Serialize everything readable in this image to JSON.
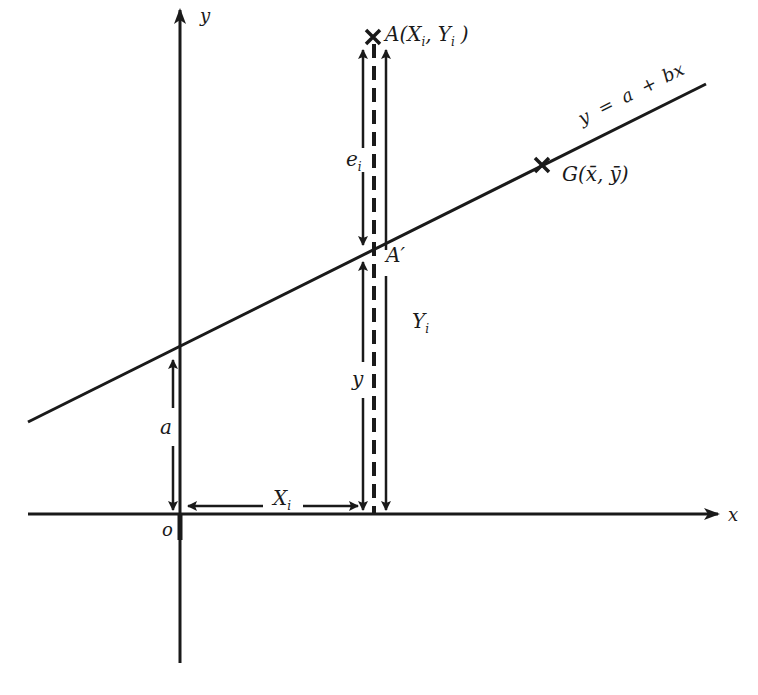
{
  "diagram": {
    "type": "least-squares regression line illustration",
    "axes": {
      "x_label": "x",
      "y_label": "y",
      "origin_label": "o"
    },
    "regression_line": {
      "equation_y": "y",
      "equation_eq": "=",
      "equation_a": "a",
      "equation_plus": "+",
      "equation_bx": "bx"
    },
    "points": {
      "A": {
        "name": "A",
        "open": "(",
        "x": "X",
        "x_sub": "i",
        "comma": ",",
        "y": "Y",
        "y_sub": "i",
        "close": ")"
      },
      "A_prime": {
        "name": "A′"
      },
      "G": {
        "name": "G",
        "open": "(",
        "x": "x̄",
        "comma": ",",
        "y": "ȳ",
        "close": ")"
      }
    },
    "dimension_labels": {
      "residual": "e",
      "residual_sub": "i",
      "observed_y": "Y",
      "observed_y_sub": "i",
      "fitted_y": "y",
      "intercept": "a",
      "x_distance": "X",
      "x_distance_sub": "i"
    },
    "colors": {
      "ink": "#1a1a1a",
      "background": "#ffffff"
    }
  }
}
